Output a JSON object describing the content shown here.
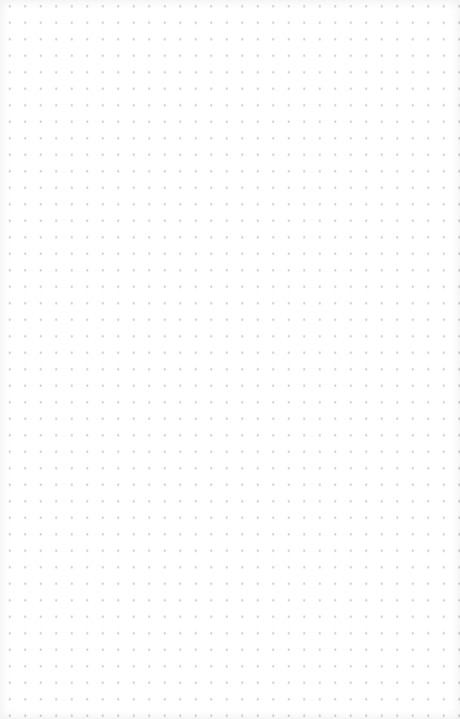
{
  "canvas": {
    "type": "dot-grid",
    "background_color": "#ffffff",
    "dot_color": "#c9c9c9",
    "dot_spacing_x": 15.5,
    "dot_spacing_y": 16.5
  }
}
